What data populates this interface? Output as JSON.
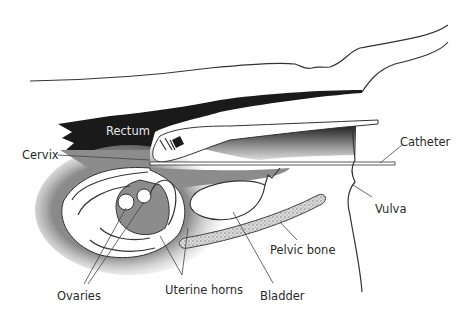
{
  "diagram": {
    "type": "anatomical-cross-section",
    "colors": {
      "rectum": "#1a1a1a",
      "tissue_shade": "#8c8c8c",
      "background": "#ffffff",
      "outline": "#333333",
      "bone_stipple": "#bdbdbd"
    },
    "labels": {
      "rectum": "Rectum",
      "cervix": "Cervix",
      "catheter": "Catheter",
      "vulva": "Vulva",
      "pelvic_bone": "Pelvic bone",
      "bladder": "Bladder",
      "uterine_horns": "Uterine horns",
      "ovaries": "Ovaries"
    }
  }
}
